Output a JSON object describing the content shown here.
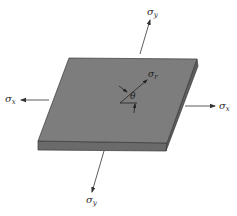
{
  "figure": {
    "colors": {
      "plate_top": "#7d7d7d",
      "plate_edge": "#6a6a6a",
      "plate_outline": "#3a3a3a",
      "arrows": "#333333",
      "background": "#ffffff"
    },
    "labels": {
      "sigma_y_top": {
        "symbol": "σ",
        "subscript": "y"
      },
      "sigma_y_bottom": {
        "symbol": "σ",
        "subscript": "y"
      },
      "sigma_x_left": {
        "symbol": "σ",
        "subscript": "x"
      },
      "sigma_x_right": {
        "symbol": "σ",
        "subscript": "x"
      },
      "sigma_r": {
        "symbol": "σ",
        "subscript": "r"
      },
      "theta": "θ"
    }
  }
}
